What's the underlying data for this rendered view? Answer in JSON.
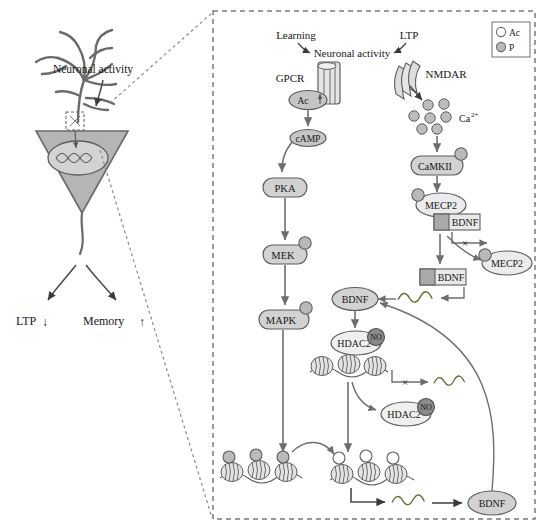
{
  "diagram": {
    "type": "biological-signaling-pathway",
    "left_panel": {
      "neuron_label": "Neuronal activity",
      "outcomes": [
        {
          "name": "ltp",
          "label": "LTP",
          "arrow": "↓"
        },
        {
          "name": "memory",
          "label": "Memory",
          "arrow": "↑"
        }
      ]
    },
    "legend": {
      "items": [
        {
          "key": "ac",
          "label": "Ac",
          "color": "#ffffff",
          "stroke": "#6b6b6b"
        },
        {
          "key": "p",
          "label": "P",
          "color": "#b9b9b9",
          "stroke": "#6b6b6b"
        }
      ]
    },
    "stimuli": [
      {
        "name": "learning",
        "label": "Learning"
      },
      {
        "name": "ltp",
        "label": "LTP"
      }
    ],
    "hub_label": "Neuronal activity",
    "receptors": [
      {
        "name": "gpcr",
        "label": "GPCR"
      },
      {
        "name": "nmdar",
        "label": "NMDAR"
      }
    ],
    "ion": {
      "label": "Ca",
      "superscript": "2+",
      "count": 7
    },
    "camp_cascade": [
      {
        "name": "adenylyl-cyclase",
        "label": "Ac",
        "shape": "ellipse"
      },
      {
        "name": "camp",
        "label": "cAMP",
        "shape": "ellipse"
      },
      {
        "name": "pka",
        "label": "PKA",
        "shape": "rounded",
        "phospho": false
      },
      {
        "name": "mek",
        "label": "MEK",
        "shape": "rounded",
        "phospho": true
      },
      {
        "name": "mapk",
        "label": "MAPK",
        "shape": "rounded",
        "phospho": true
      }
    ],
    "calcium_cascade": [
      {
        "name": "camkii",
        "label": "CaMKII",
        "shape": "rounded",
        "phospho": true
      },
      {
        "name": "mecp2-bound",
        "label": "MECP2",
        "shape": "ellipse",
        "phospho": true
      },
      {
        "name": "mecp2-released",
        "label": "MECP2",
        "shape": "ellipse",
        "phospho": true
      }
    ],
    "genes": [
      {
        "name": "bdnf-gene-repressed",
        "label": "BDNF",
        "state": "repressed"
      },
      {
        "name": "bdnf-gene-active",
        "label": "BDNF",
        "state": "active"
      }
    ],
    "proteins": [
      {
        "name": "bdnf-protein-upper",
        "label": "BDNF"
      },
      {
        "name": "bdnf-protein-lower",
        "label": "BDNF"
      }
    ],
    "hdac": [
      {
        "name": "hdac2-chromatin",
        "label": "HDAC2",
        "modification": "NO"
      },
      {
        "name": "hdac2-released",
        "label": "HDAC2",
        "modification": "NO"
      }
    ],
    "inhibition_marks": [
      {
        "name": "blocked-transcription-bdnf",
        "symbol": "×"
      },
      {
        "name": "blocked-transcription-chromatin",
        "symbol": "×"
      }
    ],
    "colors": {
      "fill_light": "#dcdcdc",
      "fill_mid": "#c8c8c8",
      "fill_dark": "#8f8f8f",
      "stroke": "#5d5d5d",
      "arrow": "#6e6e6e",
      "soma": "#b5b5b5",
      "border": "#7a7a7a"
    }
  }
}
